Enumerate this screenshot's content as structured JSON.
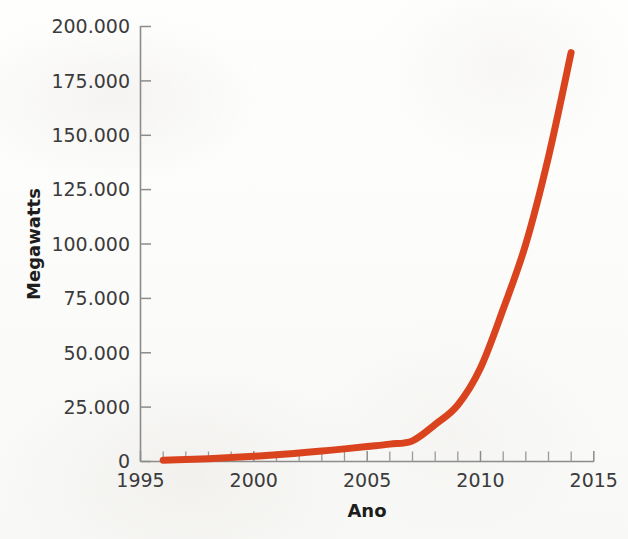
{
  "chart_data": {
    "type": "line",
    "title": "",
    "xlabel": "Ano",
    "ylabel": "Megawatts",
    "xlim": [
      1995,
      2015
    ],
    "ylim": [
      0,
      200000
    ],
    "grid": false,
    "legend": "none",
    "x_tick_labels": [
      "1995",
      "2000",
      "2005",
      "2010",
      "2015"
    ],
    "x_tick_values": [
      1995,
      2000,
      2005,
      2010,
      2015
    ],
    "x_minor_tick_values": [
      1996,
      1997,
      1998,
      1999,
      2001,
      2002,
      2003,
      2004,
      2006,
      2007,
      2008,
      2009,
      2011,
      2012,
      2013,
      2014
    ],
    "y_tick_labels": [
      "0",
      "25.000",
      "50.000",
      "75.000",
      "100.000",
      "125.000",
      "150.000",
      "175.000",
      "200.000"
    ],
    "y_tick_values": [
      0,
      25000,
      50000,
      75000,
      100000,
      125000,
      150000,
      175000,
      200000
    ],
    "series": [
      {
        "name": "Capacidade instalada",
        "color": "#d9441f",
        "x": [
          1996,
          1997,
          1998,
          1999,
          2000,
          2001,
          2002,
          2003,
          2004,
          2005,
          2006,
          2007,
          2008,
          2009,
          2010,
          2011,
          2012,
          2013,
          2014
        ],
        "values": [
          600,
          900,
          1300,
          1800,
          2400,
          3100,
          3900,
          4800,
          5800,
          6900,
          8000,
          9500,
          17000,
          26000,
          43000,
          70000,
          100000,
          140000,
          188000
        ]
      }
    ]
  },
  "axes": {
    "y_title": "Megawatts",
    "x_title": "Ano"
  },
  "colors": {
    "line": "#d9441f",
    "axis": "#8c8c8c",
    "tick_text": "#3b3b3b",
    "title_text": "#1d1d1d",
    "background": "#fdfdfc"
  }
}
